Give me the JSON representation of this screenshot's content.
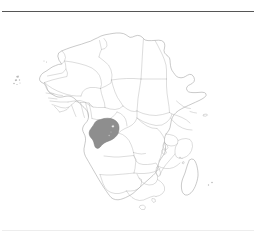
{
  "page": {
    "background_color": "#ffffff",
    "top_rule_color": "#565656",
    "bottom_rule_color": "#ededed"
  },
  "figure": {
    "title": "",
    "caption": "",
    "kind": "locator-map"
  },
  "map": {
    "name": "africa-political-outline",
    "projection_extent": "continental Africa with Madagascar and offshore islands",
    "land_fill_color": "#ffffff",
    "coastline_color": "#9d9d9d",
    "internal_border_color": "#b4b4b4",
    "island_fill_color": "#ffffff",
    "micro_island_color": "#b9b9b9"
  },
  "highlight": {
    "country": "Gabon",
    "fill_color": "#8e8e8e",
    "stroke_color": "#7a7a7a",
    "label": ""
  },
  "features": {
    "mainland_label": "Africa mainland",
    "madagascar_label": "Madagascar",
    "cape_verde_label": "Cape Verde",
    "comoros_label": "Comoros",
    "mascarenes_label": "Mascarene Islands",
    "bioko_label": "Bioko",
    "sao_tome_label": "Sao Tome and Principe",
    "zanzibar_label": "Zanzibar",
    "socotra_label": "Socotra"
  }
}
